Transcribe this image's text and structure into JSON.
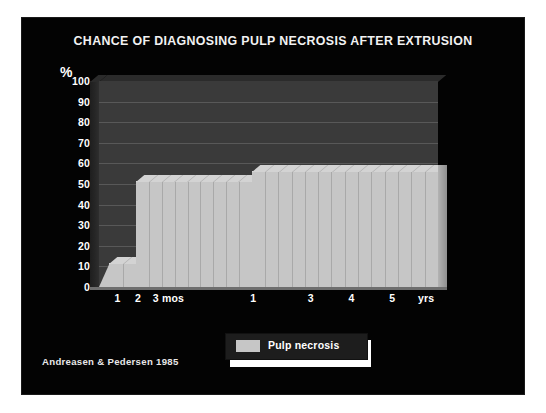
{
  "slide": {
    "title": "CHANCE OF DIAGNOSING PULP NECROSIS AFTER EXTRUSION",
    "citation": "Andreasen & Pedersen 1985",
    "background_color": "#030303",
    "title_color": "#f2f2f2"
  },
  "legend": {
    "position": "below-plot-center",
    "entries": [
      {
        "label": "Pulp necrosis",
        "color": "#c6c6c6"
      }
    ]
  },
  "chart_data": {
    "type": "area",
    "title": "CHANCE OF DIAGNOSING PULP NECROSIS AFTER EXTRUSION",
    "xlabel": "",
    "ylabel": "%",
    "ylim": [
      0,
      100
    ],
    "yticks": [
      "100",
      "90",
      "80",
      "70",
      "60",
      "50",
      "40",
      "30",
      "20",
      "10",
      "0"
    ],
    "ytick_values": [
      100,
      90,
      80,
      70,
      60,
      50,
      40,
      30,
      20,
      10,
      0
    ],
    "grid": true,
    "grid_color": "#585858",
    "plot_background": "#3a3a3a",
    "legend_position": "bottom-center",
    "xticks": [
      {
        "label": "1",
        "unit": "mos",
        "x_frac": 0.055
      },
      {
        "label": "2",
        "unit": "mos",
        "x_frac": 0.115
      },
      {
        "label": "3 mos",
        "unit": "mos",
        "x_frac": 0.205
      },
      {
        "label": "1",
        "unit": "yrs",
        "x_frac": 0.455
      },
      {
        "label": "3",
        "unit": "yrs",
        "x_frac": 0.625
      },
      {
        "label": "4",
        "unit": "yrs",
        "x_frac": 0.745
      },
      {
        "label": "5",
        "unit": "yrs",
        "x_frac": 0.865
      },
      {
        "label": "yrs",
        "unit": "yrs",
        "x_frac": 0.965
      }
    ],
    "series": [
      {
        "name": "Pulp necrosis",
        "color": "#c6c6c6",
        "steps": [
          {
            "label": "0 to 1 mos",
            "value": 0,
            "x_start_frac": 0.0,
            "x_end_frac": 0.03,
            "segments": 1
          },
          {
            "label": "1 to 2 mos",
            "value": 11,
            "x_start_frac": 0.03,
            "x_end_frac": 0.11,
            "segments": 2
          },
          {
            "label": "2 mos to 1 yr",
            "value": 51,
            "x_start_frac": 0.11,
            "x_end_frac": 0.45,
            "segments": 9
          },
          {
            "label": "1 to 5+ yrs",
            "value": 56,
            "x_start_frac": 0.45,
            "x_end_frac": 1.0,
            "segments": 14
          }
        ]
      }
    ]
  }
}
